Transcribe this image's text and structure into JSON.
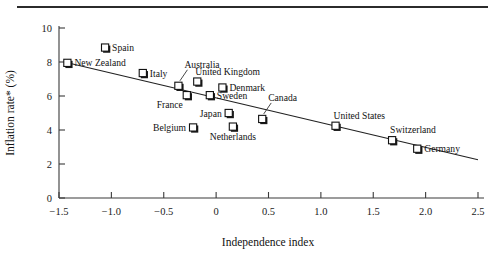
{
  "figure": {
    "has_top_rule": true,
    "background": "#ffffff",
    "line_color": "#222222",
    "marker_fill": "#ffffff",
    "marker_stroke": "#111111"
  },
  "chart_data": {
    "type": "scatter",
    "title": "",
    "xlabel": "Independence index",
    "ylabel": "Inflation rate* (%)",
    "xlim": [
      -1.5,
      2.5
    ],
    "ylim": [
      0,
      10
    ],
    "grid": false,
    "legend": "none",
    "xticks": [
      -1.5,
      -1.0,
      -0.5,
      0,
      0.5,
      1.0,
      1.5,
      2.0,
      2.5
    ],
    "xtick_labels": [
      "−1.5",
      "−1.0",
      "−0.5",
      "0",
      "0.5",
      "1.0",
      "1.5",
      "2.0",
      "2.5"
    ],
    "yticks": [
      0,
      2,
      4,
      6,
      8,
      10
    ],
    "ytick_labels": [
      "0",
      "2",
      "4",
      "6",
      "8",
      "10"
    ],
    "points": [
      {
        "label": "New Zealand",
        "x": -1.42,
        "y": 7.95,
        "label_pos": "right"
      },
      {
        "label": "Spain",
        "x": -1.06,
        "y": 8.85,
        "label_pos": "right"
      },
      {
        "label": "Italy",
        "x": -0.7,
        "y": 7.35,
        "label_pos": "right"
      },
      {
        "label": "Australia",
        "x": -0.36,
        "y": 6.6,
        "label_pos": "leader-up"
      },
      {
        "label": "United Kingdom",
        "x": -0.18,
        "y": 6.85,
        "label_pos": "above-right"
      },
      {
        "label": "France",
        "x": -0.28,
        "y": 6.05,
        "label_pos": "below-left"
      },
      {
        "label": "Denmark",
        "x": 0.06,
        "y": 6.5,
        "label_pos": "right"
      },
      {
        "label": "Sweden",
        "x": -0.06,
        "y": 6.05,
        "label_pos": "right"
      },
      {
        "label": "Japan",
        "x": 0.12,
        "y": 5.0,
        "label_pos": "left"
      },
      {
        "label": "Belgium",
        "x": -0.22,
        "y": 4.15,
        "label_pos": "left"
      },
      {
        "label": "Netherlands",
        "x": 0.16,
        "y": 4.2,
        "label_pos": "below"
      },
      {
        "label": "Canada",
        "x": 0.44,
        "y": 4.65,
        "label_pos": "leader-up"
      },
      {
        "label": "United States",
        "x": 1.14,
        "y": 4.25,
        "label_pos": "above-right"
      },
      {
        "label": "Switzerland",
        "x": 1.68,
        "y": 3.4,
        "label_pos": "above-right"
      },
      {
        "label": "Germany",
        "x": 1.92,
        "y": 2.9,
        "label_pos": "right"
      }
    ],
    "trendline": {
      "description": "least-squares fit",
      "x_start": -1.45,
      "y_start": 8.0,
      "x_end": 2.5,
      "y_end": 2.25
    },
    "footnote_marker": "*"
  }
}
